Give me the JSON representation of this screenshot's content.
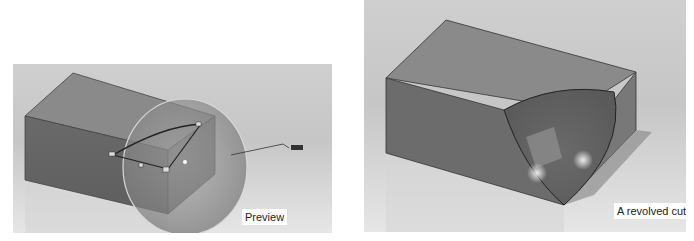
{
  "figures": [
    {
      "id": "preview",
      "caption": "Preview",
      "description": "Rectangular block with a spherical revolve preview overlay, sketch profile and dimension callout"
    },
    {
      "id": "result",
      "caption": "A revolved cut",
      "description": "Rectangular block with a spherical pocket cut into its corner"
    }
  ],
  "colors": {
    "background": "#c8c8c8",
    "block_top": "#8c8c8c",
    "block_front": "#6e6e6e",
    "block_side": "#7b7b7b",
    "preview_sphere": "#9a9a9a",
    "caption_bg": "#ffffff"
  }
}
